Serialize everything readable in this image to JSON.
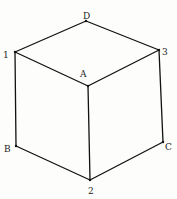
{
  "diagram": {
    "type": "cube",
    "line_color": "#111111",
    "vertices": {
      "D": {
        "x": 86,
        "y": 21
      },
      "1": {
        "x": 15,
        "y": 52
      },
      "3": {
        "x": 159,
        "y": 50
      },
      "A": {
        "x": 88,
        "y": 86
      },
      "B": {
        "x": 16,
        "y": 146
      },
      "C": {
        "x": 163,
        "y": 142
      },
      "2": {
        "x": 90,
        "y": 180
      }
    },
    "labels": {
      "D": "D",
      "one": "1",
      "three": "3",
      "A": "A",
      "B": "B",
      "C": "C",
      "two": "2"
    },
    "edges": [
      [
        "D",
        "1"
      ],
      [
        "D",
        "3"
      ],
      [
        "1",
        "A"
      ],
      [
        "3",
        "A"
      ],
      [
        "1",
        "B"
      ],
      [
        "A",
        "2"
      ],
      [
        "3",
        "C"
      ],
      [
        "B",
        "2"
      ],
      [
        "C",
        "2"
      ]
    ]
  }
}
